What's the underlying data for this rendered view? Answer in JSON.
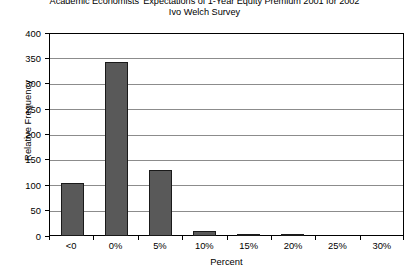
{
  "chart_data": {
    "type": "bar",
    "title": "Academic Economists' Expectations of 1-Year Equity Premium 2001 for 2002",
    "subtitle": "Ivo Welch Survey",
    "xlabel": "Percent",
    "ylabel": "Relative Frequency",
    "categories": [
      "<0",
      "0%",
      "5%",
      "10%",
      "15%",
      "20%",
      "25%",
      "30%"
    ],
    "values": [
      105,
      342,
      130,
      9,
      3,
      3,
      0,
      0
    ],
    "ylim": [
      0,
      400
    ],
    "yticks": [
      0,
      50,
      100,
      150,
      200,
      250,
      300,
      350,
      400
    ],
    "ytick_labels": [
      "0",
      "50",
      "100",
      "150",
      "200",
      "250",
      "300",
      "350",
      "400"
    ],
    "grid": "horizontal",
    "legend": "none",
    "bar_color": "#595959",
    "bar_border_color": "#1a1a1a",
    "gridline_color": "#8c8c8c",
    "axis_color": "#000000",
    "background_color": "#ffffff"
  }
}
